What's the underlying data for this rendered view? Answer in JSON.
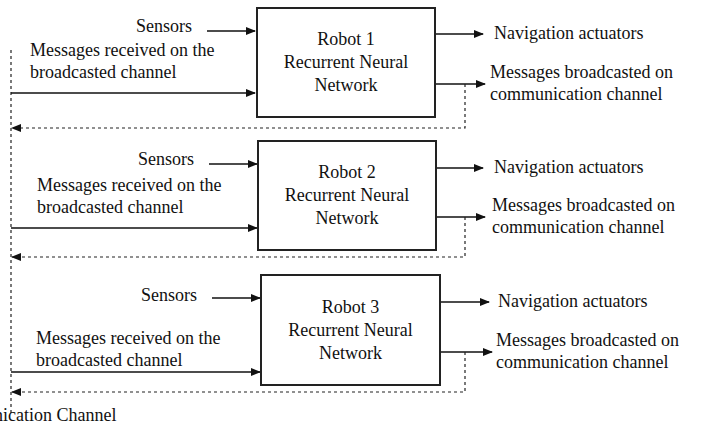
{
  "diagram": {
    "robots": [
      {
        "name": "Robot 1",
        "line2": "Recurrent Neural",
        "line3": "Network",
        "inputs": {
          "sensors": "Sensors",
          "messages_line1": "Messages received on the",
          "messages_line2": "broadcasted channel"
        },
        "outputs": {
          "navigation": "Navigation actuators",
          "broadcast_line1": "Messages broadcasted on",
          "broadcast_line2": "communication channel"
        }
      },
      {
        "name": "Robot 2",
        "line2": "Recurrent Neural",
        "line3": "Network",
        "inputs": {
          "sensors": "Sensors",
          "messages_line1": "Messages received on the",
          "messages_line2": "broadcasted channel"
        },
        "outputs": {
          "navigation": "Navigation actuators",
          "broadcast_line1": "Messages broadcasted on",
          "broadcast_line2": "communication channel"
        }
      },
      {
        "name": "Robot 3",
        "line2": "Recurrent Neural",
        "line3": "Network",
        "inputs": {
          "sensors": "Sensors",
          "messages_line1": "Messages received on the",
          "messages_line2": "broadcasted channel"
        },
        "outputs": {
          "navigation": "Navigation actuators",
          "broadcast_line1": "Messages broadcasted on",
          "broadcast_line2": "communication channel"
        }
      }
    ],
    "bottom_label": "nication Channel"
  }
}
